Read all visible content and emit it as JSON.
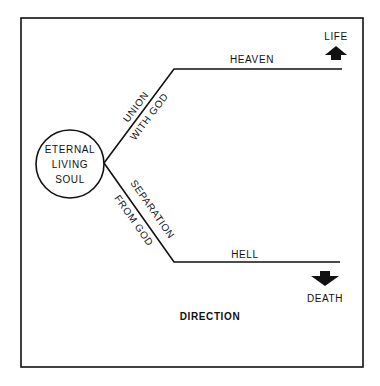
{
  "diagram": {
    "soul": {
      "line1": "ETERNAL",
      "line2": "LIVING",
      "line3": "SOUL"
    },
    "upper_branch": {
      "line_label_1": "UNION",
      "line_label_2": "WITH GOD",
      "destination": "HEAVEN",
      "outcome": "LIFE",
      "arrow_direction": "up"
    },
    "lower_branch": {
      "line_label_1": "SEPARATION",
      "line_label_2": "FROM GOD",
      "destination": "HELL",
      "outcome": "DEATH",
      "arrow_direction": "down"
    },
    "footer_label": "DIRECTION",
    "colors": {
      "stroke": "#111111",
      "background": "#ffffff"
    }
  }
}
